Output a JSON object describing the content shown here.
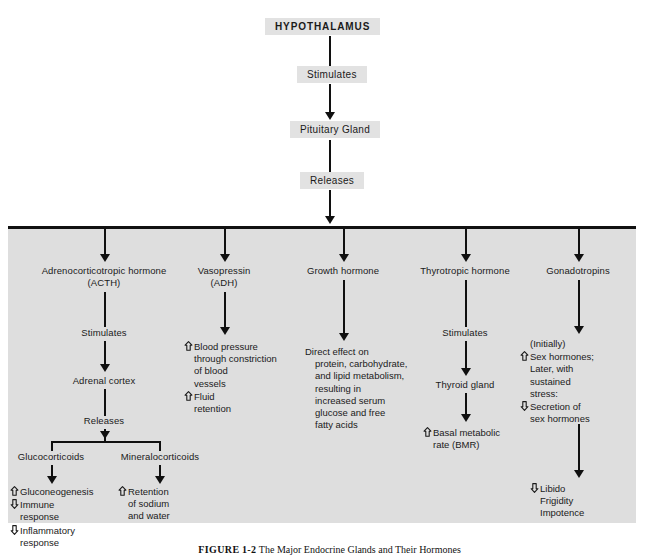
{
  "figure": {
    "title_box": "HYPOTHALAMUS",
    "caption_label": "FIGURE",
    "caption_number": "1-2",
    "caption_text": "The Major Endocrine Glands and Their Hormones"
  },
  "colors": {
    "panel_bg": "#dedede",
    "chip_bg": "#e2e2e2",
    "line": "#101010",
    "text": "#1a1a1a"
  },
  "trunk": {
    "step1_label": "Stimulates",
    "gland_label": "Pituitary Gland",
    "step2_label": "Releases"
  },
  "columns": [
    {
      "id": "acth",
      "hormone": "Adrenocorticotropic hormone",
      "hormone_abbrev": "(ACTH)",
      "action": "Stimulates",
      "target": "Adrenal cortex",
      "action2": "Releases",
      "branches": [
        {
          "id": "glucocorticoids",
          "label": "Glucocorticoids"
        },
        {
          "id": "mineralocorticoids",
          "label": "Mineralocorticoids"
        }
      ],
      "effects_left": [
        {
          "arrow": "up",
          "text": "Gluconeogenesis",
          "indent": 0
        },
        {
          "arrow": "down",
          "text": "Immune",
          "indent": 0
        },
        {
          "arrow": "none",
          "text": "response",
          "indent": 1
        },
        {
          "arrow": "down",
          "text": "Inflammatory",
          "indent": 0
        },
        {
          "arrow": "none",
          "text": "response",
          "indent": 1
        }
      ],
      "effects_right": [
        {
          "arrow": "up",
          "text": "Retention",
          "indent": 0
        },
        {
          "arrow": "none",
          "text": "of sodium",
          "indent": 1
        },
        {
          "arrow": "none",
          "text": "and water",
          "indent": 1
        }
      ]
    },
    {
      "id": "adh",
      "hormone": "Vasopressin",
      "hormone_abbrev": "(ADH)",
      "effects": [
        {
          "arrow": "up",
          "text": "Blood pressure",
          "indent": 0
        },
        {
          "arrow": "none",
          "text": "through constriction",
          "indent": 1
        },
        {
          "arrow": "none",
          "text": "of blood",
          "indent": 1
        },
        {
          "arrow": "none",
          "text": "vessels",
          "indent": 1
        },
        {
          "arrow": "up",
          "text": "Fluid",
          "indent": 0
        },
        {
          "arrow": "none",
          "text": "retention",
          "indent": 1
        }
      ]
    },
    {
      "id": "growth-hormone",
      "hormone": "Growth hormone",
      "hormone_abbrev": "",
      "effects": [
        {
          "arrow": "none",
          "text": "Direct effect on",
          "indent": 0
        },
        {
          "arrow": "none",
          "text": "protein, carbohydrate,",
          "indent": 1
        },
        {
          "arrow": "none",
          "text": "and lipid metabolism,",
          "indent": 1
        },
        {
          "arrow": "none",
          "text": "resulting in",
          "indent": 1
        },
        {
          "arrow": "none",
          "text": "increased serum",
          "indent": 1
        },
        {
          "arrow": "none",
          "text": "glucose and free",
          "indent": 1
        },
        {
          "arrow": "none",
          "text": "fatty acids",
          "indent": 1
        }
      ]
    },
    {
      "id": "thyrotropic",
      "hormone": "Thyrotropic hormone",
      "hormone_abbrev": "",
      "action": "Stimulates",
      "target": "Thyroid gland",
      "effects": [
        {
          "arrow": "up",
          "text": "Basal metabolic",
          "indent": 0
        },
        {
          "arrow": "none",
          "text": "rate (BMR)",
          "indent": 1
        }
      ]
    },
    {
      "id": "gonadotropins",
      "hormone": "Gonadotropins",
      "hormone_abbrev": "",
      "effects": [
        {
          "arrow": "none",
          "text": "(Initially)",
          "indent": 1
        },
        {
          "arrow": "up",
          "text": "Sex hormones;",
          "indent": 0
        },
        {
          "arrow": "none",
          "text": "Later, with",
          "indent": 1
        },
        {
          "arrow": "none",
          "text": "sustained",
          "indent": 1
        },
        {
          "arrow": "none",
          "text": "stress:",
          "indent": 1
        },
        {
          "arrow": "down",
          "text": "Secretion of",
          "indent": 0
        },
        {
          "arrow": "none",
          "text": "sex hormones",
          "indent": 1
        }
      ],
      "effects2": [
        {
          "arrow": "down",
          "text": "Libido",
          "indent": 0
        },
        {
          "arrow": "none",
          "text": "Frigidity",
          "indent": 1
        },
        {
          "arrow": "none",
          "text": "Impotence",
          "indent": 1
        }
      ]
    }
  ]
}
